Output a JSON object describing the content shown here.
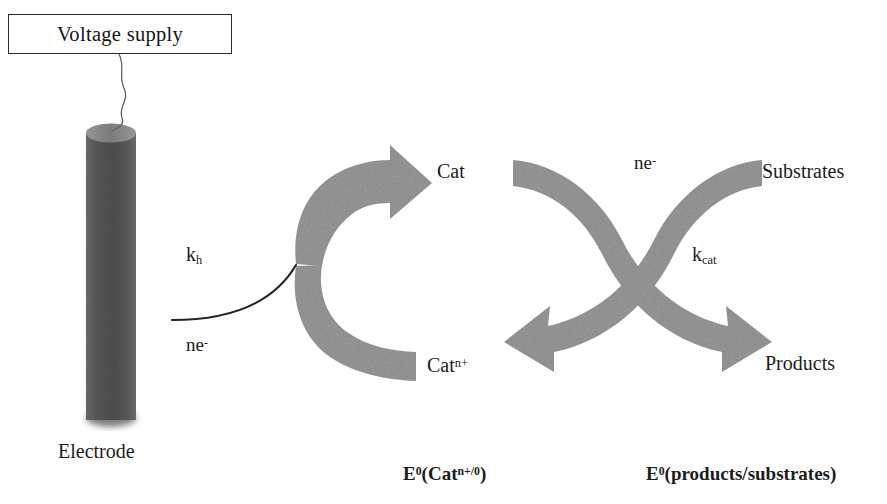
{
  "figure": {
    "background_color": "#ffffff",
    "arrow_gray": "#9a9a9a",
    "electrode_dark": "#555555",
    "electrode_top_gray": "#8a8a8a",
    "text_color": "#1c1c1c"
  },
  "voltage_supply": {
    "label": "Voltage  supply",
    "border_color": "#2b2b2b"
  },
  "electrode": {
    "label": "Electrode"
  },
  "wire": {
    "name": "wavy-wire"
  },
  "left_cycle": {
    "rate_constant": "k",
    "rate_constant_sub": "h",
    "electrons": "ne",
    "electrons_sup": "-",
    "species_reduced": "Cat",
    "species_oxidized": "Cat",
    "species_oxidized_sup": "n+",
    "potential_label_e": "E",
    "potential_label_e_sup": "0",
    "potential_label_rest": "(Cat",
    "potential_label_sup2": "n+/0",
    "potential_label_close": ")"
  },
  "right_cycle": {
    "electrons": "ne",
    "electrons_sup": "-",
    "rate_constant": "k",
    "rate_constant_sub": "cat",
    "substrates": "Substrates",
    "products": "Products",
    "potential_label_e": "E",
    "potential_label_e_sup": "0",
    "potential_label_rest": "(products/substrates)"
  }
}
